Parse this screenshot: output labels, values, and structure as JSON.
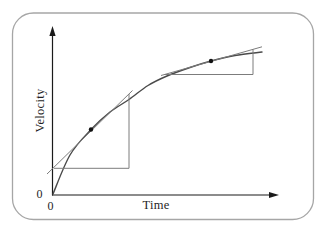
{
  "chart_data": {
    "type": "line",
    "title": "",
    "xlabel": "Time",
    "ylabel": "Velocity",
    "origin_label_y": "0",
    "origin_label_x": "0",
    "grid": false,
    "legend": false,
    "series": [
      {
        "name": "velocity-vs-time",
        "shape": "concave saturating rise toward terminal velocity",
        "points_px": [
          [
            53,
            194
          ],
          [
            70,
            155
          ],
          [
            91,
            129.5
          ],
          [
            110,
            112
          ],
          [
            129,
            99.5
          ],
          [
            148,
            85.5
          ],
          [
            167,
            76
          ],
          [
            190,
            67.5
          ],
          [
            211,
            61
          ],
          [
            235,
            55.5
          ],
          [
            262,
            52
          ]
        ]
      }
    ],
    "annotations": {
      "tangent_points_px": [
        [
          91,
          129.5
        ],
        [
          211,
          61
        ]
      ],
      "tangents": [
        {
          "line_px": [
            [
              47,
              174
            ],
            [
              132.5,
              90.5
            ]
          ],
          "triangle_px": {
            "h_y": 168.3,
            "h_x1": 54,
            "h_x2": 129,
            "v_x": 129,
            "v_y_top": 94
          }
        },
        {
          "line_px": [
            [
              161,
              75.5
            ],
            [
              262,
              46.8
            ]
          ],
          "triangle_px": {
            "h_y": 74.5,
            "h_x1": 164,
            "h_x2": 253,
            "v_x": 253,
            "v_y_top": 49.4
          }
        }
      ]
    },
    "geometry": {
      "origin_px": [
        52.5,
        195
      ],
      "y_axis_top_px": 26,
      "x_axis_right_px": 279
    },
    "colors": {
      "axis": "#1a1a1a",
      "curve": "#4a4a4a",
      "construction": "#7c7c7c",
      "point": "#111111",
      "border": "#a6a6a6",
      "background": "#ffffff",
      "ink": "#1f1f1f"
    }
  }
}
